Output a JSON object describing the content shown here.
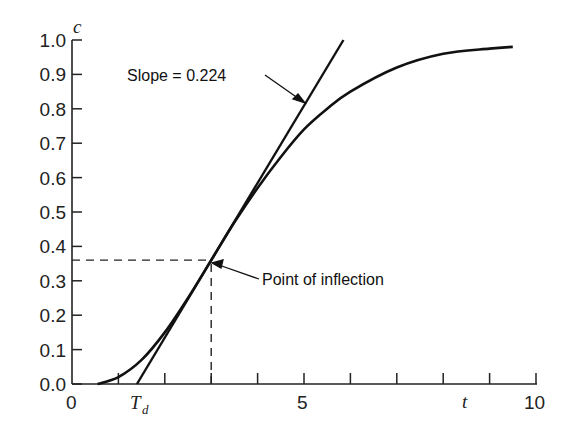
{
  "chart_data": {
    "type": "line",
    "title": "",
    "xlabel": "t",
    "ylabel": "c",
    "xlim": [
      0,
      10
    ],
    "ylim": [
      0,
      1.0
    ],
    "x_tick_labels": [
      "0",
      "5",
      "10"
    ],
    "x_ticks": [
      0,
      1,
      2,
      3,
      4,
      5,
      6,
      7,
      8,
      9,
      10
    ],
    "y_tick_labels": [
      "0.0",
      "0.1",
      "0.2",
      "0.3",
      "0.4",
      "0.5",
      "0.6",
      "0.7",
      "0.8",
      "0.9",
      "1.0"
    ],
    "grid": false,
    "series": [
      {
        "name": "response curve",
        "x": [
          0.55,
          1.0,
          1.5,
          2.0,
          2.5,
          3.0,
          3.5,
          4.0,
          4.5,
          5.0,
          5.5,
          6.0,
          7.0,
          8.0,
          9.0,
          9.5
        ],
        "y": [
          0.0,
          0.02,
          0.07,
          0.15,
          0.25,
          0.36,
          0.47,
          0.57,
          0.66,
          0.74,
          0.8,
          0.85,
          0.92,
          0.96,
          0.975,
          0.98
        ]
      },
      {
        "name": "tangent line",
        "x": [
          1.4,
          5.85
        ],
        "y": [
          0.0,
          1.0
        ]
      }
    ],
    "annotations": [
      {
        "text": "Slope = 0.224",
        "points_to": "tangent line near t=4.9"
      },
      {
        "text": "Point of inflection",
        "x": 3.0,
        "y": 0.36
      },
      {
        "text": "T_d",
        "x": 1.4,
        "note": "dead time label on x-axis"
      }
    ],
    "reference_lines": [
      {
        "type": "horizontal-dashed",
        "y": 0.36,
        "from_x": 0,
        "to_x": 3.0
      },
      {
        "type": "vertical-dashed",
        "x": 3.0,
        "from_y": 0,
        "to_y": 0.36
      }
    ]
  },
  "labels": {
    "slope": "Slope = 0.224",
    "inflection": "Point of inflection",
    "td_main": "T",
    "td_sub": "d",
    "xvar": "t",
    "yvar": "c",
    "x0": "0",
    "x5": "5",
    "x10": "10"
  }
}
